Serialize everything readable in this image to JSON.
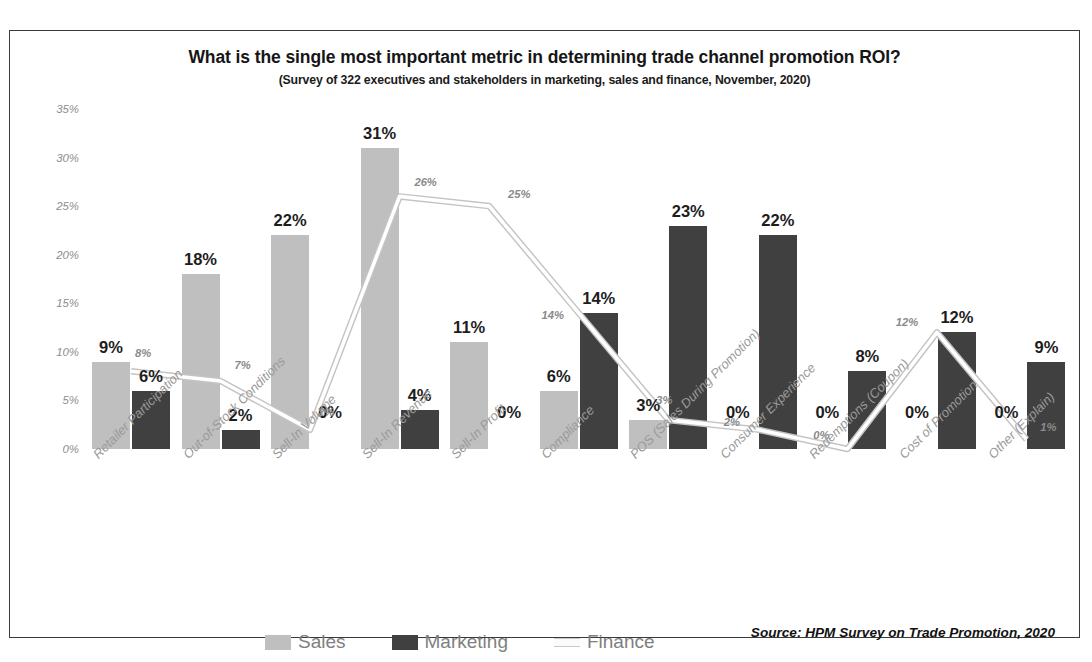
{
  "chart_data": {
    "type": "bar",
    "title": "What is the single most important metric in determining trade channel promotion ROI?",
    "subtitle": "(Survey of 322 executives and stakeholders in marketing, sales and finance, November, 2020)",
    "xlabel": "",
    "ylabel": "",
    "ylim": [
      0,
      35
    ],
    "grid": false,
    "legend_position": "bottom",
    "yticks": [
      "0%",
      "5%",
      "10%",
      "15%",
      "20%",
      "25%",
      "30%",
      "35%"
    ],
    "ytick_values": [
      0,
      5,
      10,
      15,
      20,
      25,
      30,
      35
    ],
    "categories": [
      "Retailer Participation",
      "Out-of-Stock Conditions",
      "Sell-In Volume",
      "Sell-In Revenue",
      "Sell-In Profit",
      "Compliance",
      "POS (Sales During Promotion)",
      "Consumer Experience",
      "Redemptions (Coupon)",
      "Cost of Promotion",
      "Other (Explain)"
    ],
    "series": [
      {
        "name": "Sales",
        "type": "bar",
        "color": "#bfbfbf",
        "values": [
          9,
          18,
          22,
          31,
          11,
          6,
          3,
          0,
          0,
          0,
          0
        ],
        "labels": [
          "9%",
          "18%",
          "22%",
          "31%",
          "11%",
          "6%",
          "3%",
          "0%",
          "0%",
          "0%",
          "0%"
        ]
      },
      {
        "name": "Marketing",
        "type": "bar",
        "color": "#404040",
        "values": [
          6,
          2,
          0,
          4,
          0,
          14,
          23,
          22,
          8,
          12,
          9
        ],
        "labels": [
          "6%",
          "2%",
          "0%",
          "4%",
          "0%",
          "14%",
          "23%",
          "22%",
          "8%",
          "12%",
          "9%"
        ]
      },
      {
        "name": "Finance",
        "type": "line",
        "color": "#c9c9c9",
        "values": [
          8,
          7,
          2,
          26,
          25,
          14,
          3,
          2,
          0,
          12,
          1
        ],
        "labels": [
          "8%",
          "7%",
          "2%",
          "26%",
          "25%",
          "14%",
          "3%",
          "2%",
          "0%",
          "12%",
          "1%"
        ]
      }
    ],
    "source_note": "Source: HPM Survey on Trade Promotion, 2020"
  },
  "legend": {
    "items": [
      {
        "label": "Sales",
        "swatch": "sales"
      },
      {
        "label": "Marketing",
        "swatch": "marketing"
      },
      {
        "label": "Finance",
        "swatch": "finance"
      }
    ]
  }
}
